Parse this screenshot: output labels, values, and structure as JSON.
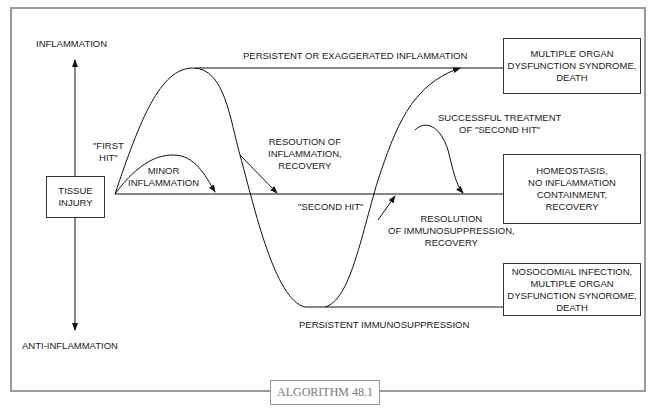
{
  "axis": {
    "top_label": "INFLAMMATION",
    "bottom_label": "ANTI-INFLAMMATION"
  },
  "nodes": {
    "start": "TISSUE\nINJURY",
    "mods": "MULTIPLE ORGAN\nDYSFUNCTION SYNDROME,\nDEATH",
    "homeostasis": "HOMEOSTASIS,\nNO INFLAMMATION\nCONTAINMENT,\nRECOVERY",
    "nosocomial": "NOSOCOMIAL INFECTION,\nMULTIPLE ORGAN\nDYSFUNCTION SYNOROME,\nDEATH"
  },
  "labels": {
    "persistent_inflammation": "PERSISTENT OR EXAGGERATED INFLAMMATION",
    "first_hit": "\"FIRST\nHIT\"",
    "minor_inflammation": "MINOR\nINFLAMMATION",
    "resolution_inflammation": "RESOUTION OF\nINFLAMMATION,\nRECOVERY",
    "second_hit": "\"SECOND HIT\"",
    "successful_treatment": "SUCCESSFUL TREATMENT\nOF \"SECOND HIT\"",
    "resolution_immunosuppression": "RESOLUTION\nOF IMMUNOSUPPRESSION,\nRECOVERY",
    "persistent_immunosuppression": "PERSISTENT IMMUNOSUPPRESSION"
  },
  "caption": "ALGORITHM 48.1"
}
